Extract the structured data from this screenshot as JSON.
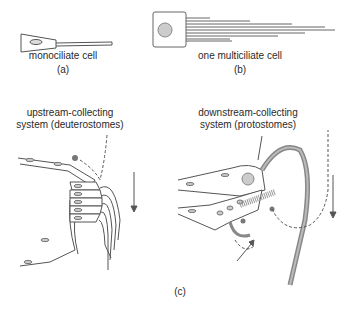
{
  "panel_a": {
    "caption": "monociliate cell",
    "label": "(a)"
  },
  "panel_b": {
    "caption": "one multiciliate cell",
    "label": "(b)"
  },
  "panel_c": {
    "label": "(c)",
    "left": {
      "title_line1": "upstream-collecting",
      "title_line2": "system (deuterostomes)"
    },
    "right": {
      "title_line1": "downstream-collecting",
      "title_line2": "system (protostomes)"
    }
  },
  "colors": {
    "stroke": "#555555",
    "fill_cilia": "#8a8a8a",
    "dot": "#777777"
  }
}
